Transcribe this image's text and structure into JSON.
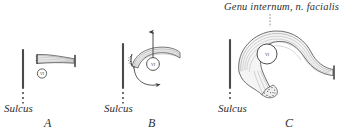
{
  "figure": {
    "caption_title": "Genu internum, n. facialis",
    "background_color": "#ffffff",
    "ink_color": "#3a3a3a"
  },
  "panels": [
    {
      "letter": "A",
      "sulcus_label": "Sulcus",
      "nucleus_label": "VI",
      "description": "straight tapered facial nerve bundle lateral to sulcus"
    },
    {
      "letter": "B",
      "sulcus_label": "Sulcus",
      "nucleus_label": "VI",
      "description": "nerve bundle beginning to sweep over abducens nucleus",
      "arrows": [
        "up-arrow",
        "rotation-arrow"
      ]
    },
    {
      "letter": "C",
      "sulcus_label": "Sulcus",
      "nucleus_label": "VI",
      "description": "nerve forming complete internal genu looping around abducens nucleus"
    }
  ]
}
